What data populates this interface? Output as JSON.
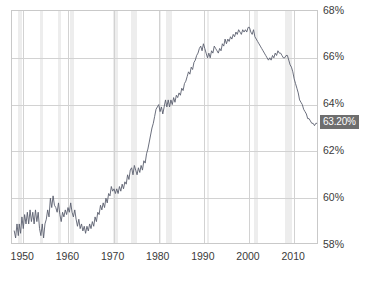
{
  "chart_data": {
    "type": "line",
    "title": "",
    "subtitle": "",
    "xlabel": "",
    "ylabel": "",
    "xlim": [
      1947.5,
      2015.5
    ],
    "ylim": [
      58,
      68
    ],
    "grid": true,
    "legend": null,
    "y_unit": "%",
    "y_ticks": [
      "58%",
      "60%",
      "62%",
      "64%",
      "66%",
      "68%"
    ],
    "y_tick_values": [
      58,
      60,
      62,
      64,
      66,
      68
    ],
    "x_ticks": [
      "1950",
      "1960",
      "1970",
      "1980",
      "1990",
      "2000",
      "2010"
    ],
    "x_tick_values": [
      1950,
      1960,
      1970,
      1980,
      1990,
      2000,
      2010
    ],
    "last_value_label": "63.20%",
    "last_value": 63.2,
    "line_color": "#5a5f6e",
    "band_color": "#ededed",
    "grid_color": "#d2d2d2",
    "axis_color": "#c9c9c9",
    "badge_bg": "#6e6e6e",
    "badge_text_color": "#ffffff",
    "recession_bands": [
      {
        "start": 1948.9,
        "end": 1949.8
      },
      {
        "start": 1953.6,
        "end": 1954.4
      },
      {
        "start": 1957.7,
        "end": 1958.4
      },
      {
        "start": 1960.3,
        "end": 1961.2
      },
      {
        "start": 1969.9,
        "end": 1970.9
      },
      {
        "start": 1973.9,
        "end": 1975.2
      },
      {
        "start": 1980.0,
        "end": 1980.6
      },
      {
        "start": 1981.6,
        "end": 1982.9
      },
      {
        "start": 1990.6,
        "end": 1991.2
      },
      {
        "start": 2001.2,
        "end": 2001.9
      },
      {
        "start": 2007.9,
        "end": 2009.5
      }
    ],
    "series": [
      {
        "name": "Labor Force Participation Rate",
        "x": [
          1948.0,
          1948.3,
          1948.6,
          1948.9,
          1949.1,
          1949.4,
          1949.7,
          1950.0,
          1950.3,
          1950.6,
          1950.9,
          1951.2,
          1951.5,
          1951.8,
          1952.1,
          1952.4,
          1952.7,
          1953.0,
          1953.3,
          1953.6,
          1953.9,
          1954.2,
          1954.5,
          1954.8,
          1955.1,
          1955.4,
          1955.7,
          1956.0,
          1956.3,
          1956.6,
          1956.9,
          1957.2,
          1957.5,
          1957.8,
          1958.1,
          1958.4,
          1958.7,
          1959.0,
          1959.3,
          1959.6,
          1959.9,
          1960.2,
          1960.5,
          1960.8,
          1961.1,
          1961.4,
          1961.7,
          1962.0,
          1962.3,
          1962.6,
          1962.9,
          1963.2,
          1963.5,
          1963.8,
          1964.1,
          1964.4,
          1964.7,
          1965.0,
          1965.3,
          1965.6,
          1965.9,
          1966.2,
          1966.5,
          1966.8,
          1967.1,
          1967.4,
          1967.7,
          1968.0,
          1968.3,
          1968.6,
          1968.9,
          1969.2,
          1969.5,
          1969.8,
          1970.1,
          1970.4,
          1970.7,
          1971.0,
          1971.3,
          1971.6,
          1971.9,
          1972.2,
          1972.5,
          1972.8,
          1973.1,
          1973.4,
          1973.7,
          1974.0,
          1974.3,
          1974.6,
          1974.9,
          1975.2,
          1975.5,
          1975.8,
          1976.1,
          1976.4,
          1976.7,
          1977.0,
          1977.3,
          1977.6,
          1977.9,
          1978.2,
          1978.5,
          1978.8,
          1979.1,
          1979.4,
          1979.7,
          1980.0,
          1980.3,
          1980.6,
          1980.9,
          1981.2,
          1981.5,
          1981.8,
          1982.1,
          1982.4,
          1982.7,
          1983.0,
          1983.3,
          1983.6,
          1983.9,
          1984.2,
          1984.5,
          1984.8,
          1985.1,
          1985.4,
          1985.7,
          1986.0,
          1986.3,
          1986.6,
          1986.9,
          1987.2,
          1987.5,
          1987.8,
          1988.1,
          1988.4,
          1988.7,
          1989.0,
          1989.3,
          1989.6,
          1989.9,
          1990.2,
          1990.5,
          1990.8,
          1991.1,
          1991.4,
          1991.7,
          1992.0,
          1992.3,
          1992.6,
          1992.9,
          1993.2,
          1993.5,
          1993.8,
          1994.1,
          1994.4,
          1994.7,
          1995.0,
          1995.3,
          1995.6,
          1995.9,
          1996.2,
          1996.5,
          1996.8,
          1997.1,
          1997.4,
          1997.7,
          1998.0,
          1998.3,
          1998.6,
          1998.9,
          1999.2,
          1999.5,
          1999.8,
          2000.1,
          2000.4,
          2000.7,
          2001.0,
          2001.3,
          2001.6,
          2001.9,
          2002.2,
          2002.5,
          2002.8,
          2003.1,
          2003.4,
          2003.7,
          2004.0,
          2004.3,
          2004.6,
          2004.9,
          2005.2,
          2005.5,
          2005.8,
          2006.1,
          2006.4,
          2006.7,
          2007.0,
          2007.3,
          2007.6,
          2007.9,
          2008.2,
          2008.5,
          2008.8,
          2009.1,
          2009.4,
          2009.7,
          2010.0,
          2010.3,
          2010.6,
          2010.9,
          2011.2,
          2011.5,
          2011.8,
          2012.1,
          2012.4,
          2012.7,
          2013.0,
          2013.3,
          2013.6,
          2013.9,
          2014.2,
          2014.5,
          2014.8,
          2015.1,
          2015.3
        ],
        "values": [
          58.6,
          58.3,
          58.9,
          58.4,
          58.9,
          58.5,
          59.2,
          58.7,
          59.3,
          58.9,
          59.4,
          58.9,
          59.5,
          59.0,
          59.4,
          58.9,
          59.5,
          59.0,
          59.4,
          58.7,
          58.4,
          58.9,
          58.3,
          58.9,
          59.1,
          59.5,
          59.2,
          60.0,
          59.6,
          60.1,
          59.7,
          59.6,
          59.4,
          59.8,
          59.3,
          59.0,
          59.4,
          59.2,
          59.5,
          59.3,
          59.6,
          59.4,
          59.8,
          59.4,
          59.2,
          59.5,
          59.1,
          58.8,
          59.1,
          58.7,
          58.9,
          58.6,
          58.8,
          58.5,
          58.8,
          58.6,
          58.9,
          58.7,
          59.0,
          58.8,
          59.2,
          59.0,
          59.4,
          59.3,
          59.7,
          59.5,
          59.8,
          59.6,
          60.0,
          59.8,
          60.2,
          60.1,
          60.5,
          60.3,
          60.4,
          60.2,
          60.4,
          60.2,
          60.5,
          60.3,
          60.6,
          60.4,
          60.7,
          60.6,
          61.0,
          60.8,
          61.2,
          61.3,
          61.0,
          61.4,
          61.2,
          61.0,
          61.3,
          61.1,
          61.4,
          61.2,
          61.6,
          61.5,
          61.9,
          62.1,
          62.4,
          62.7,
          63.0,
          63.2,
          63.5,
          63.8,
          63.9,
          64.0,
          63.7,
          63.9,
          63.6,
          63.9,
          64.2,
          63.9,
          64.2,
          63.9,
          64.2,
          64.0,
          64.3,
          64.1,
          64.4,
          64.3,
          64.5,
          64.4,
          64.7,
          64.6,
          64.9,
          65.0,
          65.2,
          65.4,
          65.3,
          65.6,
          65.5,
          65.8,
          65.9,
          66.1,
          66.2,
          66.4,
          66.5,
          66.3,
          66.6,
          66.4,
          66.2,
          66.0,
          66.2,
          66.0,
          66.3,
          66.2,
          66.5,
          66.4,
          66.3,
          66.2,
          66.4,
          66.3,
          66.6,
          66.5,
          66.8,
          66.6,
          66.8,
          66.7,
          66.9,
          66.8,
          67.0,
          66.9,
          67.1,
          67.0,
          67.2,
          67.1,
          67.0,
          67.2,
          67.1,
          67.2,
          67.1,
          67.3,
          67.3,
          67.1,
          67.0,
          67.2,
          66.9,
          66.8,
          66.7,
          66.6,
          66.5,
          66.4,
          66.3,
          66.2,
          66.1,
          66.0,
          65.9,
          66.0,
          65.9,
          66.1,
          66.0,
          66.2,
          66.1,
          66.3,
          66.2,
          66.2,
          66.1,
          66.0,
          66.0,
          66.1,
          66.1,
          65.9,
          65.7,
          65.6,
          65.4,
          65.1,
          64.9,
          64.7,
          64.5,
          64.2,
          64.1,
          64.0,
          63.8,
          63.7,
          63.6,
          63.4,
          63.4,
          63.3,
          63.2,
          63.2,
          63.1,
          63.2,
          63.2,
          63.2
        ]
      }
    ]
  }
}
